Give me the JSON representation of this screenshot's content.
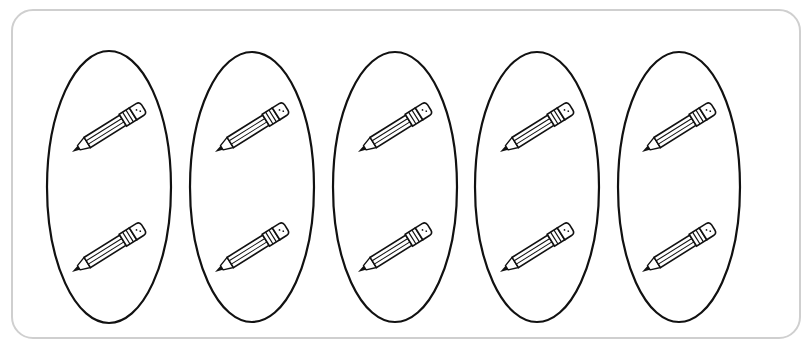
{
  "figure": {
    "group_count": 5,
    "items_per_group": 2,
    "total_items": 10,
    "item_icon": "pencil-icon",
    "colors": {
      "frame_border": "#cfcfcf",
      "outline": "#111111",
      "background": "#ffffff"
    }
  },
  "groups": [
    {
      "cx": 109,
      "cy": 187,
      "rx": 62,
      "ry": 136,
      "items": [
        {
          "x": 72,
          "y": 152
        },
        {
          "x": 72,
          "y": 272
        }
      ]
    },
    {
      "cx": 252,
      "cy": 187,
      "rx": 62,
      "ry": 135,
      "items": [
        {
          "x": 215,
          "y": 152
        },
        {
          "x": 215,
          "y": 272
        }
      ]
    },
    {
      "cx": 395,
      "cy": 187,
      "rx": 62,
      "ry": 135,
      "items": [
        {
          "x": 358,
          "y": 152
        },
        {
          "x": 358,
          "y": 272
        }
      ]
    },
    {
      "cx": 537,
      "cy": 187,
      "rx": 62,
      "ry": 135,
      "items": [
        {
          "x": 500,
          "y": 152
        },
        {
          "x": 500,
          "y": 272
        }
      ]
    },
    {
      "cx": 679,
      "cy": 187,
      "rx": 61,
      "ry": 135,
      "items": [
        {
          "x": 642,
          "y": 152
        },
        {
          "x": 642,
          "y": 272
        }
      ]
    }
  ]
}
